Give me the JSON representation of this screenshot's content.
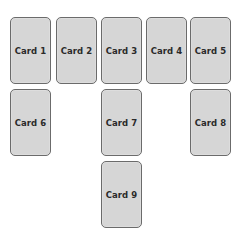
{
  "layout": {
    "description": "Card grid layout with 5 columns",
    "columns": 5,
    "rows": 3
  },
  "cards": [
    {
      "id": 1,
      "label": "Card 1",
      "row": 1,
      "col": 1
    },
    {
      "id": 2,
      "label": "Card 2",
      "row": 1,
      "col": 2
    },
    {
      "id": 3,
      "label": "Card 3",
      "row": 1,
      "col": 3
    },
    {
      "id": 4,
      "label": "Card 4",
      "row": 1,
      "col": 4
    },
    {
      "id": 5,
      "label": "Card 5",
      "row": 1,
      "col": 5
    },
    {
      "id": 6,
      "label": "Card 6",
      "row": 2,
      "col": 1
    },
    {
      "id": 7,
      "label": "Card 7",
      "row": 2,
      "col": 3
    },
    {
      "id": 8,
      "label": "Card 8",
      "row": 2,
      "col": 5
    },
    {
      "id": 9,
      "label": "Card 9",
      "row": 3,
      "col": 3
    }
  ],
  "colors": {
    "card_fill": "#d6d6d6",
    "card_border": "#6b6b6b",
    "label_text": "#2a2a2a",
    "background": "#ffffff"
  }
}
